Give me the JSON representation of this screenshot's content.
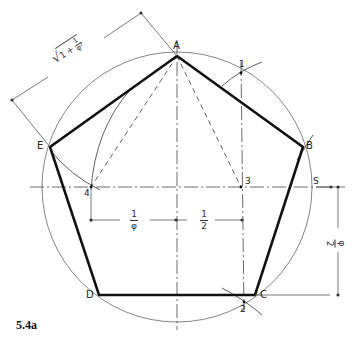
{
  "figure": {
    "caption": "5.4a",
    "vertices": [
      {
        "label": "A",
        "x": 177,
        "y": 56
      },
      {
        "label": "B",
        "x": 303,
        "y": 147
      },
      {
        "label": "C",
        "x": 255,
        "y": 295
      },
      {
        "label": "D",
        "x": 99,
        "y": 295
      },
      {
        "label": "E",
        "x": 50,
        "y": 147
      }
    ],
    "construction_points": [
      {
        "label": "1",
        "x": 241,
        "y": 73
      },
      {
        "label": "2",
        "x": 244,
        "y": 303
      },
      {
        "label": "3",
        "x": 241,
        "y": 187
      },
      {
        "label": "4",
        "x": 91,
        "y": 187
      },
      {
        "label": "S",
        "x": 313,
        "y": 187
      }
    ],
    "circle": {
      "cx": 177,
      "cy": 187,
      "r": 135
    },
    "dimensions": {
      "diagonal_label": "√(1 + 1/φ²)",
      "sqrt_symbol": "√",
      "one": "1",
      "plus": "+",
      "phi_squared": "φ²",
      "horizontal_left_num": "1",
      "horizontal_left_den": "φ",
      "horizontal_right_num": "1",
      "horizontal_right_den": "2",
      "vertical_label": "φ/2",
      "vertical_num": "φ",
      "vertical_den": "2"
    },
    "colors": {
      "stroke": "#111111",
      "thin": "#555555",
      "background": "#ffffff"
    }
  }
}
